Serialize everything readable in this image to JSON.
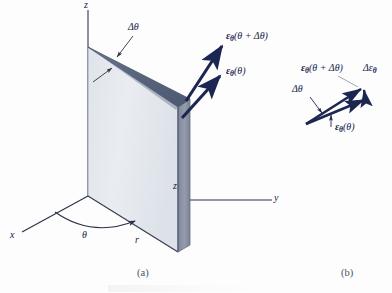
{
  "figure": {
    "title_alt": "Unit vector increment in cylindrical coordinates",
    "background_color": "#fdfdfd"
  },
  "colors": {
    "plane_light": "#e4e8ed",
    "plane_light_edge": "#9aa3b2",
    "plane_dark_strip": "#8d95a8",
    "wedge_top": "#5d6880",
    "wedge_top_highlight": "#848fa6",
    "arrow_navy": "#1b2750",
    "axis_line": "#2a3247",
    "leader_line": "#3a4258",
    "text": "#15214a",
    "caption": "#4a5268"
  },
  "panel_a": {
    "caption": "(a)",
    "axes": [
      {
        "name": "z-axis",
        "label": "z"
      },
      {
        "name": "y-axis",
        "label": "y"
      },
      {
        "name": "x-axis",
        "label": "x"
      }
    ],
    "axis_z_label": "z",
    "axis_y_label": "y",
    "axis_x_label": "x",
    "inner_z_label": "z",
    "radial_label": "r",
    "angle_label": "θ",
    "delta_theta_label": "Δθ",
    "vector_labels": {
      "outer": {
        "symbol": "ε",
        "sub": "θ",
        "arg": "(θ + Δθ)",
        "full": "εθ(θ + Δθ)"
      },
      "inner": {
        "symbol": "ε",
        "sub": "θ",
        "arg": "(θ)",
        "full": "εθ(θ)"
      }
    }
  },
  "panel_b": {
    "caption": "(b)",
    "delta_theta_label": "Δθ",
    "vector_labels": {
      "outer": {
        "symbol": "ε",
        "sub": "θ",
        "arg": "(θ + Δθ)",
        "full": "εθ(θ + Δθ)"
      },
      "inner": {
        "symbol": "ε",
        "sub": "θ",
        "arg": "(θ)",
        "full": "εθ(θ)"
      },
      "difference": {
        "symbol": "Δε",
        "sub": "θ",
        "full": "Δεθ"
      }
    }
  }
}
